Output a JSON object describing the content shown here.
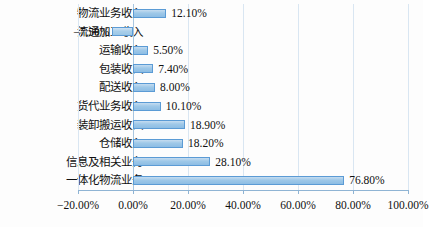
{
  "chart_data": {
    "type": "bar",
    "orientation": "horizontal",
    "title": "",
    "xlabel": "",
    "ylabel": "",
    "xlim": [
      -20,
      100
    ],
    "xticks": [
      -20,
      0,
      20,
      40,
      60,
      80,
      100
    ],
    "xtick_labels": [
      "−20.00%",
      "0.00%",
      "20.00%",
      "40.00%",
      "60.00%",
      "80.00%",
      "100.00%"
    ],
    "grid": true,
    "legend": "none",
    "categories": [
      "物流业务收入",
      "流通加工收入",
      "运输收入",
      "包装收入",
      "配送收入",
      "货代业务收入",
      "装卸搬运收入",
      "仓储收入",
      "信息及相关业务",
      "一体化物流业务"
    ],
    "values": [
      12.1,
      -7.5,
      5.5,
      7.4,
      8.0,
      10.1,
      18.9,
      18.2,
      28.1,
      76.8
    ],
    "value_labels": [
      "12.10%",
      "−7.50%",
      "5.50%",
      "7.40%",
      "8.00%",
      "10.10%",
      "18.90%",
      "18.20%",
      "28.10%",
      "76.80%"
    ],
    "colors": {
      "bar_fill": "#9ec8e8",
      "bar_border": "#5b9bd5",
      "gridline": "#d9e6f2",
      "axis": "#8fb4d4",
      "text": "#111111",
      "background": "#fdfdfd"
    }
  }
}
